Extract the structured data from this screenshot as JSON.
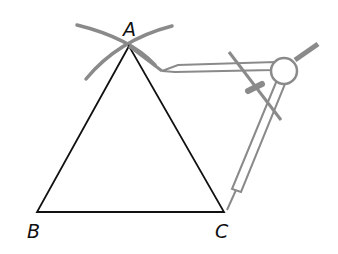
{
  "diagram": {
    "vertices": [
      {
        "id": "A",
        "label": "A",
        "x": 129,
        "y": 46
      },
      {
        "id": "B",
        "label": "B",
        "x": 37,
        "y": 212
      },
      {
        "id": "C",
        "label": "C",
        "x": 224,
        "y": 212
      }
    ],
    "edges": [
      [
        "A",
        "B"
      ],
      [
        "A",
        "C"
      ],
      [
        "B",
        "C"
      ]
    ],
    "construction_arcs": 2,
    "tool": "compass",
    "colors": {
      "triangle": "#111111",
      "arcs": "#8a8a8a",
      "compass": "#8a8a8a",
      "background": "#ffffff"
    }
  }
}
